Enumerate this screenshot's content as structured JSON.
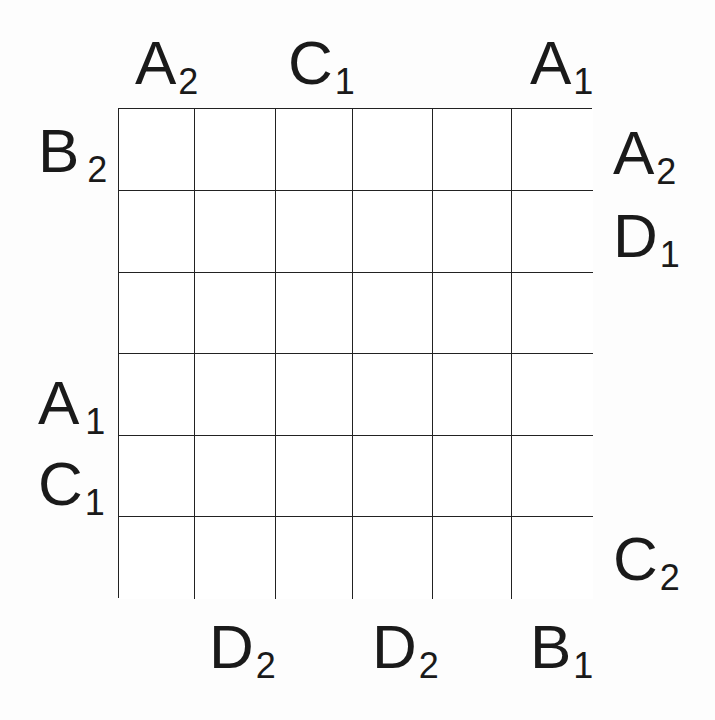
{
  "puzzle": {
    "rows": 6,
    "cols": 6,
    "cells": [
      [
        "",
        "",
        "",
        "",
        "",
        ""
      ],
      [
        "",
        "",
        "",
        "",
        "",
        ""
      ],
      [
        "",
        "",
        "",
        "",
        "",
        ""
      ],
      [
        "",
        "",
        "",
        "",
        "",
        ""
      ],
      [
        "",
        "",
        "",
        "",
        "",
        ""
      ],
      [
        "",
        "",
        "",
        "",
        "",
        ""
      ]
    ],
    "clues": {
      "top": [
        {
          "letter": "A",
          "sub": "2",
          "col": 1
        },
        {
          "letter": "C",
          "sub": "1",
          "col": 3
        },
        {
          "letter": "A",
          "sub": "1",
          "col": 6
        }
      ],
      "left": [
        {
          "letter": "B",
          "sub": "2",
          "row": 1
        },
        {
          "letter": "A",
          "sub": "1",
          "row": 4
        },
        {
          "letter": "C",
          "sub": "1",
          "row": 5
        }
      ],
      "right": [
        {
          "letter": "A",
          "sub": "2",
          "row": 1
        },
        {
          "letter": "D",
          "sub": "1",
          "row": 2
        },
        {
          "letter": "C",
          "sub": "2",
          "row": 6
        }
      ],
      "bottom": [
        {
          "letter": "D",
          "sub": "2",
          "col": 2
        },
        {
          "letter": "D",
          "sub": "2",
          "col": 4
        },
        {
          "letter": "B",
          "sub": "1",
          "col": 6
        }
      ]
    }
  }
}
